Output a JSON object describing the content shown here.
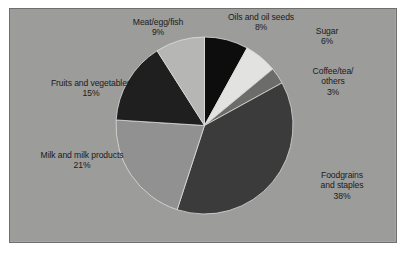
{
  "figure": {
    "background_color": "#ffffff",
    "panel_color": "#9c9c9a",
    "panel_border_color": "#6f6f6d",
    "label_text_color": "#1b1b1b"
  },
  "chart_data": {
    "type": "pie",
    "title": "",
    "xlabel": "",
    "ylabel": "",
    "legend_position": "none",
    "grid": false,
    "units": "percent",
    "start_angle_deg": 0,
    "direction": "clockwise",
    "total": 100,
    "categories": [
      "Oils and oil seeds",
      "Sugar",
      "Coffee/tea/others",
      "Foodgrains and staples",
      "Milk and milk products",
      "Fruits and vegetables",
      "Meat/egg/fish"
    ],
    "values": [
      8,
      6,
      3,
      38,
      21,
      15,
      9
    ],
    "slices": [
      {
        "name": "oils-and-oil-seeds",
        "line1": "Oils and oil seeds",
        "line2": "",
        "line3": "",
        "percent_label": "8%",
        "value": 8,
        "color": "#0d0d0d"
      },
      {
        "name": "sugar",
        "line1": "Sugar",
        "line2": "",
        "line3": "",
        "percent_label": "6%",
        "value": 6,
        "color": "#e2e2e0"
      },
      {
        "name": "coffee-tea-others",
        "line1": "Coffee/tea/",
        "line2": "others",
        "line3": "",
        "percent_label": "3%",
        "value": 3,
        "color": "#6c6c6a"
      },
      {
        "name": "foodgrains-and-staples",
        "line1": "Foodgrains",
        "line2": "and staples",
        "line3": "",
        "percent_label": "38%",
        "value": 38,
        "color": "#3b3b3b"
      },
      {
        "name": "milk-and-milk-products",
        "line1": "Milk and milk products",
        "line2": "",
        "line3": "",
        "percent_label": "21%",
        "value": 21,
        "color": "#919191"
      },
      {
        "name": "fruits-and-vegetables",
        "line1": "Fruits and vegetables",
        "line2": "",
        "line3": "",
        "percent_label": "15%",
        "value": 15,
        "color": "#1f1f1f"
      },
      {
        "name": "meat-egg-fish",
        "line1": "Meat/egg/fish",
        "line2": "",
        "line3": "",
        "percent_label": "9%",
        "value": 9,
        "color": "#b6b6b4"
      }
    ]
  }
}
